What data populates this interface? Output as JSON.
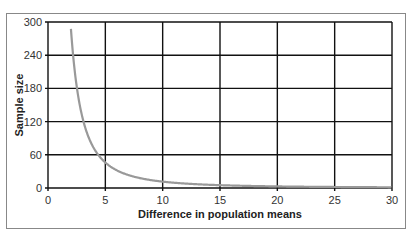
{
  "chart_data": {
    "type": "line",
    "title": "",
    "xlabel": "Difference in population means",
    "ylabel": "Sample size",
    "xlim": [
      0,
      30
    ],
    "ylim": [
      0,
      300
    ],
    "xticks": [
      0,
      5,
      10,
      15,
      20,
      25,
      30
    ],
    "yticks": [
      0,
      60,
      120,
      180,
      240,
      300
    ],
    "grid": true,
    "legend": null,
    "series": [
      {
        "name": "Sample size",
        "color": "#999999",
        "x": [
          2,
          2.25,
          2.5,
          3,
          3.5,
          4,
          4.5,
          5,
          6,
          7,
          8,
          9,
          10,
          12,
          15,
          20,
          25,
          30
        ],
        "y": [
          288,
          227,
          184,
          128,
          94,
          72,
          57,
          46,
          32,
          23,
          18,
          14,
          12,
          8,
          5,
          3,
          2,
          1
        ]
      }
    ]
  }
}
